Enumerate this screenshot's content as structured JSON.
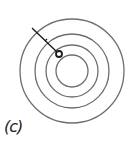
{
  "figure": {
    "label": "(c)",
    "stroke_color": "#6e6e6e",
    "line_color": "#1a1a1a",
    "center": [
      72,
      71
    ],
    "circles": [
      {
        "r": 52
      },
      {
        "r": 37
      },
      {
        "r": 26
      },
      {
        "r": 16
      }
    ],
    "radial_line": {
      "from": [
        32,
        28
      ],
      "to": [
        57,
        52
      ],
      "tick_at": [
        46,
        40
      ]
    },
    "marker": {
      "cx": 59,
      "cy": 54,
      "r": 3
    }
  }
}
